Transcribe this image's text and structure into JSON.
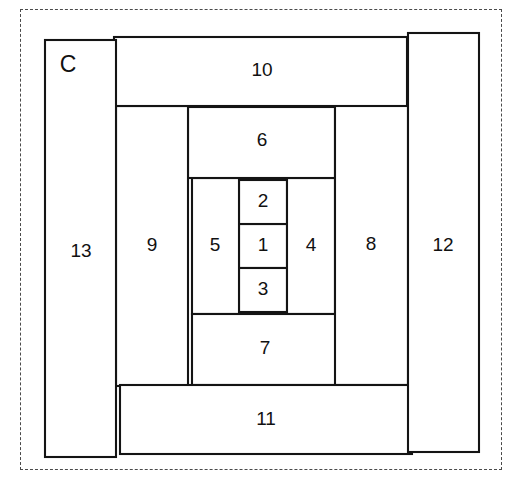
{
  "figure": {
    "block_id": "C",
    "block_id_position": {
      "x": 68,
      "y": 66
    },
    "outline": {
      "points": "44,41 478,32 484,448 46,457",
      "stroke_color": "#141414"
    },
    "trim_boundary": {
      "style": "dashed",
      "color": "#4a4a4a"
    }
  },
  "chart_data": {
    "type": "diagram",
    "title": "C",
    "pieces": [
      {
        "label": "1",
        "name": "piece-1",
        "x": 239,
        "y": 224,
        "w": 48,
        "h": 44,
        "label_x": 263,
        "label_y": 246
      },
      {
        "label": "2",
        "name": "piece-2",
        "x": 239,
        "y": 180,
        "w": 48,
        "h": 44,
        "label_x": 263,
        "label_y": 202
      },
      {
        "label": "3",
        "name": "piece-3",
        "x": 239,
        "y": 268,
        "w": 48,
        "h": 44,
        "label_x": 263,
        "label_y": 290
      },
      {
        "label": "4",
        "name": "piece-4",
        "x": 287,
        "y": 178,
        "w": 48,
        "h": 136,
        "label_x": 311,
        "label_y": 246
      },
      {
        "label": "5",
        "name": "piece-5",
        "x": 192,
        "y": 178,
        "w": 47,
        "h": 136,
        "label_x": 215,
        "label_y": 246
      },
      {
        "label": "6",
        "name": "piece-6",
        "x": 188,
        "y": 107,
        "w": 147,
        "h": 71,
        "label_x": 262,
        "label_y": 141
      },
      {
        "label": "7",
        "name": "piece-7",
        "x": 192,
        "y": 314,
        "w": 147,
        "h": 71,
        "label_x": 265,
        "label_y": 349
      },
      {
        "label": "8",
        "name": "piece-8",
        "x": 335,
        "y": 105,
        "w": 73,
        "h": 280,
        "label_x": 371,
        "label_y": 245
      },
      {
        "label": "9",
        "name": "piece-9",
        "x": 116,
        "y": 106,
        "w": 72,
        "h": 280,
        "label_x": 152,
        "label_y": 246
      },
      {
        "label": "10",
        "name": "piece-10",
        "x": 114,
        "y": 37,
        "w": 293,
        "h": 69,
        "label_x": 262,
        "label_y": 71
      },
      {
        "label": "11",
        "name": "piece-11",
        "x": 120,
        "y": 385,
        "w": 292,
        "h": 69,
        "label_x": 266,
        "label_y": 420
      },
      {
        "label": "12",
        "name": "piece-12",
        "x": 408,
        "y": 33,
        "w": 71,
        "h": 419,
        "label_x": 443,
        "label_y": 246
      },
      {
        "label": "13",
        "name": "piece-13",
        "x": 45,
        "y": 40,
        "w": 71,
        "h": 417,
        "label_x": 81,
        "label_y": 252
      }
    ]
  }
}
